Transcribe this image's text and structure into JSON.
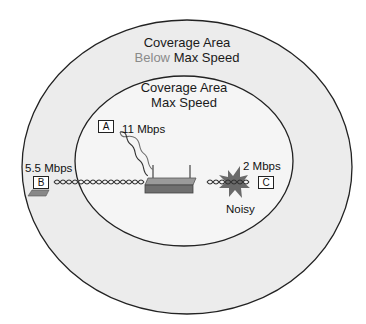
{
  "outer_zone": {
    "title_line1": "Coverage Area",
    "title_line2_highlight": "Below",
    "title_line2_rest": "Max Speed",
    "fill_color": "#ececec",
    "highlight_color": "#8a8a8a"
  },
  "inner_zone": {
    "title_line1": "Coverage Area",
    "title_line2": "Max Speed",
    "fill_color": "#f4f4f4"
  },
  "access_point": {
    "icon": "wireless-router-icon"
  },
  "clients": [
    {
      "id": "A",
      "speed": "11 Mbps",
      "icon": "client-box-icon"
    },
    {
      "id": "B",
      "speed": "5.5 Mbps",
      "icon": "laptop-icon"
    },
    {
      "id": "C",
      "speed": "2 Mbps",
      "icon": "client-box-icon"
    }
  ],
  "interference": {
    "label": "Noisy",
    "icon": "noise-burst-icon"
  }
}
